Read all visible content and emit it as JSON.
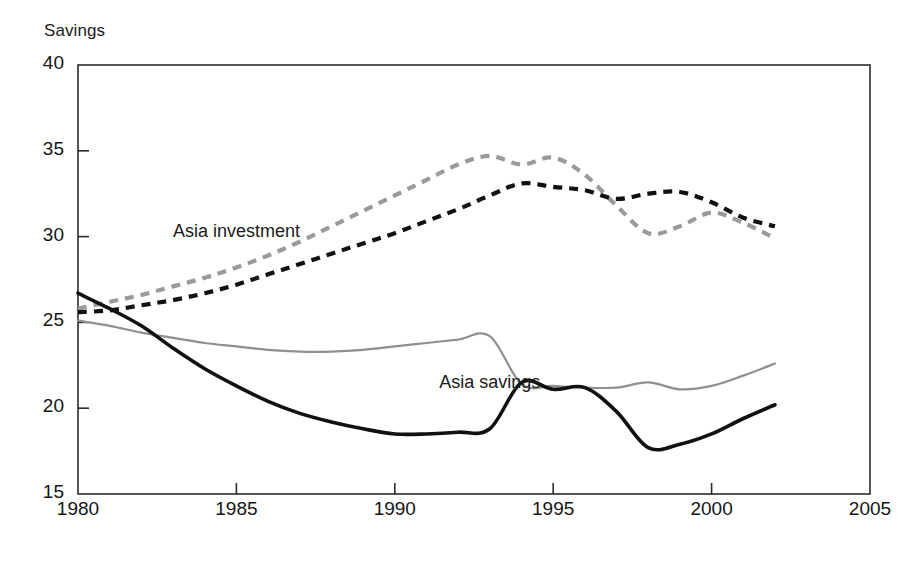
{
  "chart_data": {
    "type": "line",
    "title": "",
    "ylabel": "Savings",
    "xlabel": "",
    "xlim": [
      1980,
      2005
    ],
    "ylim": [
      15,
      40
    ],
    "grid": false,
    "legend_position": "inline-annotations",
    "x_ticks": [
      "1980",
      "1985",
      "1990",
      "1995",
      "2000",
      "2005"
    ],
    "y_ticks": [
      "15",
      "20",
      "25",
      "30",
      "35",
      "40"
    ],
    "annotations": [
      {
        "text": "Asia investment",
        "x": 1983.0,
        "y": 30.2
      },
      {
        "text": "Asia savings",
        "x": 1991.4,
        "y": 21.4
      }
    ],
    "x": [
      1980,
      1981,
      1982,
      1983,
      1984,
      1985,
      1986,
      1987,
      1988,
      1989,
      1990,
      1991,
      1992,
      1993,
      1994,
      1995,
      1996,
      1997,
      1998,
      1999,
      2000,
      2001,
      2002
    ],
    "series": [
      {
        "name": "Asia investment (dashed, grey)",
        "style": "dashed",
        "color": "#9a9a9a",
        "values": [
          25.8,
          26.2,
          26.6,
          27.1,
          27.6,
          28.2,
          28.9,
          29.7,
          30.6,
          31.5,
          32.4,
          33.3,
          34.2,
          34.7,
          34.2,
          34.6,
          33.6,
          31.8,
          30.2,
          30.6,
          31.4,
          30.8,
          29.9
        ]
      },
      {
        "name": "Asia investment (dashed, black)",
        "style": "dashed",
        "color": "#111111",
        "values": [
          25.6,
          25.7,
          26.0,
          26.3,
          26.7,
          27.2,
          27.8,
          28.4,
          29.0,
          29.6,
          30.2,
          30.9,
          31.6,
          32.4,
          33.1,
          32.9,
          32.7,
          32.2,
          32.5,
          32.6,
          32.0,
          31.1,
          30.6
        ]
      },
      {
        "name": "Asia savings (solid, grey)",
        "style": "solid",
        "color": "#8f8f8f",
        "values": [
          25.1,
          24.8,
          24.4,
          24.1,
          23.8,
          23.6,
          23.4,
          23.3,
          23.3,
          23.4,
          23.6,
          23.8,
          24.0,
          24.2,
          21.4,
          21.3,
          21.2,
          21.2,
          21.5,
          21.1,
          21.3,
          21.9,
          22.6
        ]
      },
      {
        "name": "Asia savings (solid, black)",
        "style": "solid",
        "color": "#111111",
        "values": [
          26.7,
          25.8,
          24.8,
          23.5,
          22.3,
          21.3,
          20.4,
          19.7,
          19.2,
          18.8,
          18.5,
          18.5,
          18.6,
          18.8,
          21.5,
          21.1,
          21.2,
          19.8,
          17.7,
          17.9,
          18.5,
          19.4,
          20.2
        ]
      }
    ]
  },
  "labels": {
    "y_axis_title": "Savings",
    "asia_investment": "Asia investment",
    "asia_savings": "Asia savings"
  }
}
